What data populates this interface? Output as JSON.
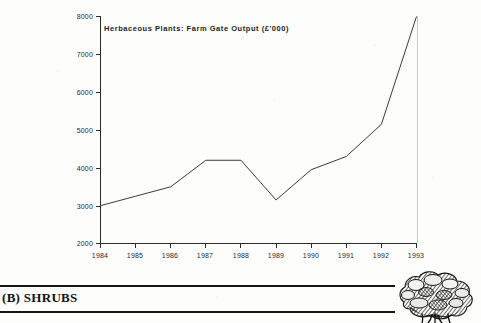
{
  "document": {
    "figure_title": "Herbaceous Plants:  Farm Gate Output  (£'000)",
    "section_label": "(B) SHRUBS",
    "shrub_icon_name": "shrub-engraving"
  },
  "chart_data": {
    "type": "line",
    "title": "Herbaceous Plants:  Farm Gate Output  (£'000)",
    "xlabel": "",
    "ylabel": "",
    "x": [
      1984,
      1985,
      1986,
      1987,
      1988,
      1989,
      1990,
      1991,
      1992,
      1993
    ],
    "categories": [
      "1984",
      "1985",
      "1986",
      "1987",
      "1988",
      "1989",
      "1990",
      "1991",
      "1992",
      "1993"
    ],
    "values": [
      3000,
      3250,
      3500,
      4200,
      4200,
      3150,
      3950,
      4300,
      5150,
      8000
    ],
    "series": [
      {
        "name": "Farm Gate Output",
        "values": [
          3000,
          3250,
          3500,
          4200,
          4200,
          3150,
          3950,
          4300,
          5150,
          8000
        ]
      }
    ],
    "ylim": [
      2000,
      8000
    ],
    "yticks": [
      2000,
      3000,
      4000,
      5000,
      6000,
      7000,
      8000
    ],
    "ytick_labels": [
      "2000",
      "3000",
      "4000",
      "5000",
      "6000",
      "7000",
      "8000"
    ],
    "xlim": [
      1984,
      1993
    ],
    "xticks": [
      1984,
      1985,
      1986,
      1987,
      1988,
      1989,
      1990,
      1991,
      1992,
      1993
    ],
    "xtick_labels": [
      "1984",
      "1985",
      "1986",
      "1987",
      "1988",
      "1989",
      "1990",
      "1991",
      "1992",
      "1993"
    ],
    "grid": false,
    "legend": "none",
    "line_color": "#3a3a3a",
    "axis_color": "#2b2b2b",
    "units": "£'000"
  }
}
